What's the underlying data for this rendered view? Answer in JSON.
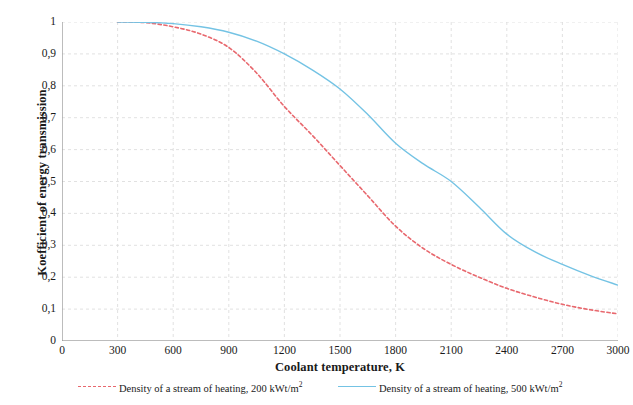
{
  "chart_data": {
    "type": "line",
    "title": "",
    "subtitle": "",
    "xlabel": "Coolant temperature, K",
    "ylabel": "Koefficient of energy transmission",
    "xlim": [
      0,
      3000
    ],
    "ylim": [
      0,
      1
    ],
    "xticks": [
      "0",
      "300",
      "600",
      "900",
      "1200",
      "1500",
      "1800",
      "2100",
      "2400",
      "2700",
      "3000"
    ],
    "yticks": [
      "0",
      "0,1",
      "0,2",
      "0,3",
      "0,4",
      "0,5",
      "0,6",
      "0,7",
      "0,8",
      "0,9",
      "1"
    ],
    "grid": true,
    "legend_position": "bottom",
    "x": [
      300,
      450,
      600,
      750,
      900,
      1050,
      1200,
      1350,
      1500,
      1650,
      1800,
      1950,
      2100,
      2250,
      2400,
      2550,
      2700,
      2850,
      3000
    ],
    "series": [
      {
        "name": "Density of a stream of heating, 200 kWt/m",
        "unit_exponent": "2",
        "color": "#e8686e",
        "style": "dashed",
        "values": [
          1.0,
          0.998,
          0.985,
          0.962,
          0.92,
          0.84,
          0.735,
          0.645,
          0.55,
          0.455,
          0.36,
          0.29,
          0.24,
          0.2,
          0.165,
          0.138,
          0.115,
          0.098,
          0.085
        ]
      },
      {
        "name": "Density of a stream of heating, 500 kWt/m",
        "unit_exponent": "2",
        "color": "#74c3e4",
        "style": "solid",
        "values": [
          1.0,
          0.999,
          0.995,
          0.985,
          0.968,
          0.94,
          0.9,
          0.85,
          0.79,
          0.71,
          0.62,
          0.555,
          0.5,
          0.42,
          0.335,
          0.28,
          0.24,
          0.205,
          0.175
        ]
      }
    ]
  },
  "legend": [
    {
      "label": "Density of a stream of heating, 200 kWt/m",
      "sup": "2",
      "style": "dashed",
      "color": "#e8686e"
    },
    {
      "label": "Density of a stream of heating, 500 kWt/m",
      "sup": "2",
      "style": "solid",
      "color": "#74c3e4"
    }
  ],
  "axes": {
    "x_title": "Coolant temperature, K",
    "y_title": "Koefficient of energy transmission"
  },
  "colors": {
    "series_200": "#e8686e",
    "series_500": "#74c3e4",
    "grid": "#d9d9d9",
    "axis": "#8c8c8c",
    "text": "#1a1a1a"
  }
}
